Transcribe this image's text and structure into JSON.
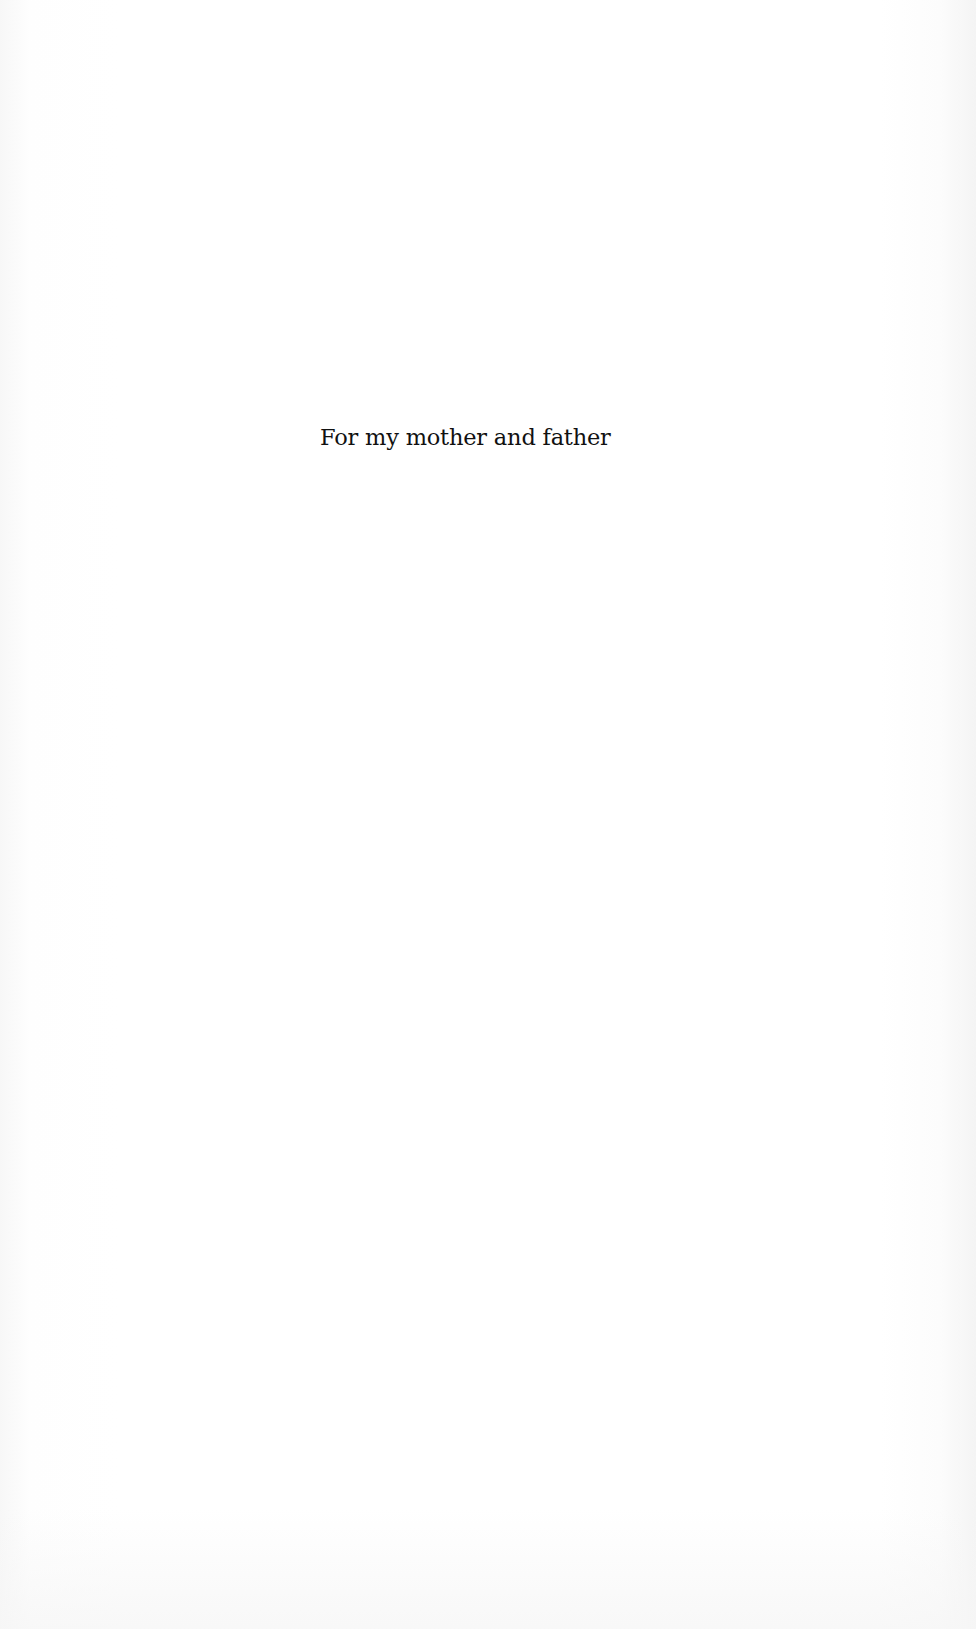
{
  "page": {
    "dedication": "For my mother and father"
  },
  "colors": {
    "background": "#ffffff",
    "text": "#111111"
  }
}
